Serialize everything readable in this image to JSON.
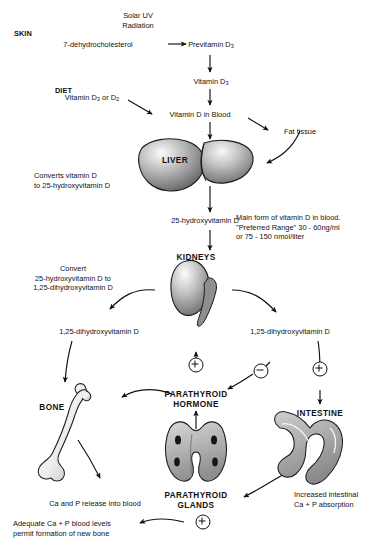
{
  "diagram": {
    "colors": {
      "ink": "#111111",
      "organ_light": "#f2f2f2",
      "organ_mid": "#9a9a9a",
      "organ_dark": "#4a4a4a",
      "background": "#ffffff"
    }
  },
  "sections": {
    "skin": "SKIN",
    "diet": "DIET"
  },
  "nodes": {
    "solar_uv": "Solar UV\nRadiation",
    "dehydrocholesterol": "7-dehydrocholesterol",
    "previtamin_d3_pre": "Previtamin D",
    "previtamin_d3_sub": "3",
    "vitamin_d3_pre": "Vitamin D",
    "vitamin_d3_sub": "3",
    "diet_vitamin_pre": "Vitamin D",
    "diet_vitamin_sub1": "3",
    "diet_vitamin_mid": " or D",
    "diet_vitamin_sub2": "2",
    "vitamin_d_blood": "Vitamin D in Blood",
    "fat_tissue": "Fat tissue",
    "liver": "LIVER",
    "liver_note": "Converts vitamin D\nto 25-hydroxyvitamin D",
    "hydroxyvitamin_d": "25-hydroxyvitamin D",
    "blood_note": "Main form of vitamin D in blood.\n\"Preferred Range\" 30 - 60ng/ml\nor 75 - 150 nmol/liter",
    "kidneys": "KIDNEYS",
    "kidney_note": "Convert\n25-hydroxyvitamin D to\n1,25-dihydroxyvitamin D",
    "dihydroxy_left": "1,25-dihydroxyvitamin D",
    "dihydroxy_right": "1,25-dihydroxyvitamin D",
    "bone": "BONE",
    "parathyroid_hormone": "PARATHYROID\nHORMONE",
    "intestine": "INTESTINE",
    "parathyroid_glands": "PARATHYROID\nGLANDS",
    "ca_p_release": "Ca and P release into blood",
    "intestinal_absorption": "Increased intestinal\nCa + P absorption",
    "adequate_levels": "Adequate Ca + P blood levels\npermit formation of new bone"
  },
  "symbols": {
    "pth_stimulate": "+",
    "pth_inhibit": "−",
    "intestine_stimulate": "+",
    "glands_feedback": "+"
  }
}
